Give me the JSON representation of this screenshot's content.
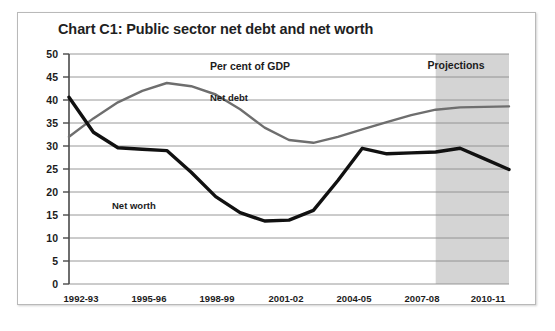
{
  "figure": {
    "title": "Chart C1: Public sector net debt and net worth",
    "background_color": "#ffffff",
    "border_color": "#b9b9b9"
  },
  "annotations": {
    "units_label": "Per cent of GDP",
    "projections_label": "Projections",
    "net_debt_label": "Net debt",
    "net_worth_label": "Net worth",
    "projections_band_color": "#d4d4d4"
  },
  "chart_data": {
    "type": "line",
    "title": "Chart C1: Public sector net debt and net worth",
    "xlabel": "",
    "ylabel": "",
    "units": "Per cent of GDP",
    "grid": true,
    "legend": "inline-labels",
    "ylim": [
      0,
      50
    ],
    "yticks": [
      0,
      5,
      10,
      15,
      20,
      25,
      30,
      35,
      40,
      45,
      50
    ],
    "xticks": [
      "1992-93",
      "1995-96",
      "1998-99",
      "2001-02",
      "2004-05",
      "2007-08",
      "2010-11"
    ],
    "x": [
      "1992-93",
      "1993-94",
      "1994-95",
      "1995-96",
      "1996-97",
      "1997-98",
      "1998-99",
      "1999-00",
      "2000-01",
      "2001-02",
      "2002-03",
      "2003-04",
      "2004-05",
      "2005-06",
      "2006-07",
      "2007-08",
      "2008-09",
      "2009-10",
      "2010-11"
    ],
    "projection_start": "2007-08",
    "series": [
      {
        "name": "Net debt",
        "color": "#6e6e6e",
        "line_width": 2.4,
        "values": [
          32.0,
          36.0,
          39.5,
          42.0,
          43.7,
          43.0,
          41.2,
          38.0,
          34.0,
          31.3,
          30.7,
          32.0,
          33.6,
          35.2,
          36.7,
          37.9,
          38.4,
          38.5,
          38.6
        ]
      },
      {
        "name": "Net worth",
        "color": "#111111",
        "line_width": 3.4,
        "values": [
          40.6,
          33.0,
          29.6,
          29.3,
          29.0,
          24.3,
          19.0,
          15.5,
          13.7,
          13.9,
          16.0,
          22.5,
          29.5,
          28.3,
          28.5,
          28.7,
          29.5,
          27.2,
          24.9
        ]
      }
    ]
  }
}
